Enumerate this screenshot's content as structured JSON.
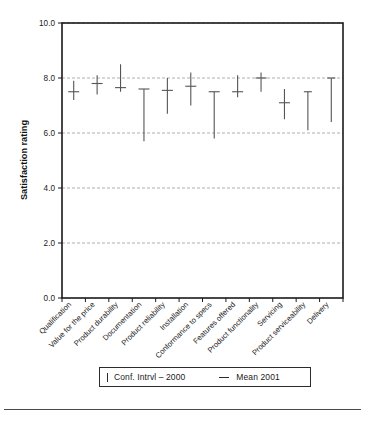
{
  "chart_data": {
    "type": "line",
    "title": "",
    "xlabel": "",
    "ylabel": "Satisfaction rating",
    "ylim": [
      0.0,
      10.0
    ],
    "yticks": [
      "0.0",
      "2.0",
      "4.0",
      "6.0",
      "8.0",
      "10.0"
    ],
    "ytick_values": [
      0.0,
      2.0,
      4.0,
      6.0,
      8.0,
      10.0
    ],
    "grid": "horizontal-dashed",
    "legend_position": "bottom",
    "categories": [
      "Qualification",
      "Value for the price",
      "Product durability",
      "Documentation",
      "Product reliability",
      "Installation",
      "Conformance to specs",
      "Features offered",
      "Product functionality",
      "Servicing",
      "Product serviceability",
      "Delivery"
    ],
    "series": [
      {
        "name": "Conf. Intrvl – 2000",
        "marker": "vertical-bar",
        "type": "errorbar",
        "lower": [
          7.2,
          7.4,
          7.5,
          5.7,
          6.7,
          7.0,
          5.8,
          7.3,
          7.5,
          6.5,
          6.1,
          6.4
        ],
        "upper": [
          7.9,
          8.1,
          8.5,
          7.6,
          8.0,
          8.2,
          7.5,
          8.1,
          8.2,
          7.6,
          7.5,
          8.0
        ]
      },
      {
        "name": "Mean 2001",
        "marker": "horizontal-dash",
        "type": "mean",
        "values": [
          7.5,
          7.8,
          7.65,
          7.6,
          7.55,
          7.7,
          7.5,
          7.5,
          8.0,
          7.1,
          null,
          null
        ]
      }
    ]
  },
  "legend": {
    "conf_label": "Conf. Intrvl – 2000",
    "mean_label": "Mean 2001"
  },
  "colors": {
    "line": "#555555",
    "axis": "#1a1a1a",
    "grid": "#9a9a9a",
    "background": "#ffffff"
  }
}
